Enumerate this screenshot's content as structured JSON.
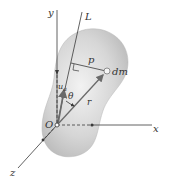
{
  "diagram": {
    "labels": {
      "y_axis": "y",
      "x_axis": "x",
      "z_axis": "z",
      "L_axis": "L",
      "origin": "O",
      "perp_distance": "p",
      "mass_element": "dm",
      "angle": "θ",
      "position_vector": "r",
      "unit_vector": "u",
      "unit_vector_sub": "a"
    },
    "colors": {
      "body_fill": "#cfcfcf",
      "body_edge": "#b5b5b5",
      "line": "#3a3a3a",
      "vector": "#6a6a6a",
      "background": "#ffffff"
    }
  }
}
